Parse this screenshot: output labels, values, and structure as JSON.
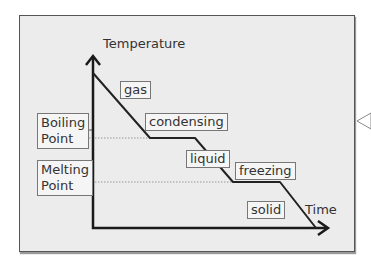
{
  "diagram": {
    "axes": {
      "y_label": "Temperature",
      "x_label": "Time"
    },
    "reference_lines": {
      "boiling": {
        "line1": "Boiling",
        "line2": "Point"
      },
      "melting": {
        "line1": "Melting",
        "line2": "Point"
      }
    },
    "segments": {
      "gas": "gas",
      "condensing": "condensing",
      "liquid": "liquid",
      "freezing": "freezing",
      "solid": "solid"
    },
    "colors": {
      "panel_bg": "#ececec",
      "line": "#222222",
      "label_border": "#777777",
      "dotted": "#999999"
    }
  }
}
